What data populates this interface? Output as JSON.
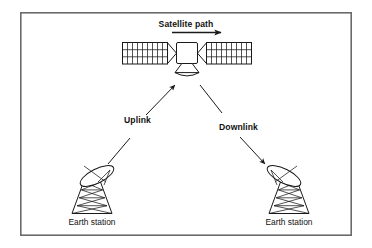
{
  "figure": {
    "title_label": "Satellite path",
    "background_color": "#ffffff",
    "line_color": "#1a1a1a",
    "frame_color": "#6a6a6a",
    "frame": {
      "x": 20,
      "y": 12,
      "width": 332,
      "height": 224
    }
  },
  "labels": {
    "satellite_path": "Satellite path",
    "uplink": "Uplink",
    "downlink": "Downlink",
    "earth_station_left": "Earth station",
    "earth_station_right": "Earth station"
  },
  "satellite": {
    "body": {
      "cx": 187,
      "cy": 53,
      "size": 21
    },
    "panel_rows": 3,
    "panel_cols": 9,
    "left_panel": {
      "x": 122,
      "y": 42,
      "width": 46,
      "height": 22
    },
    "right_panel": {
      "x": 206,
      "y": 42,
      "width": 46,
      "height": 22
    },
    "antenna": {
      "cx": 187,
      "cy": 70
    }
  },
  "path_arrow": {
    "from_x": 186,
    "to_x": 222,
    "y": 31,
    "direction": "right"
  },
  "links": {
    "uplink": {
      "label": "Uplink",
      "start": {
        "x": 108,
        "y": 163
      },
      "end": {
        "x": 174,
        "y": 86
      },
      "direction": "up-right",
      "label_pos": {
        "x": 122,
        "y": 119
      }
    },
    "downlink": {
      "label": "Downlink",
      "start": {
        "x": 201,
        "y": 86
      },
      "end": {
        "x": 265,
        "y": 163
      },
      "direction": "down-right",
      "label_pos": {
        "x": 222,
        "y": 126
      }
    }
  },
  "earth_stations": [
    {
      "name": "earth-station-left",
      "label": "Earth station",
      "tower": {
        "apex_x": 92,
        "top_y": 183,
        "base_y": 213,
        "top_half_w": 9,
        "base_half_w": 20
      },
      "dish_tilt_deg": -28,
      "dish_cx": 95,
      "dish_cy": 175,
      "label_pos": {
        "x": 92,
        "y": 224
      }
    },
    {
      "name": "earth-station-right",
      "label": "Earth station",
      "tower": {
        "apex_x": 287,
        "top_y": 183,
        "base_y": 213,
        "top_half_w": 9,
        "base_half_w": 20
      },
      "dish_tilt_deg": 28,
      "dish_cx": 284,
      "dish_cy": 175,
      "label_pos": {
        "x": 289,
        "y": 224
      }
    }
  ]
}
